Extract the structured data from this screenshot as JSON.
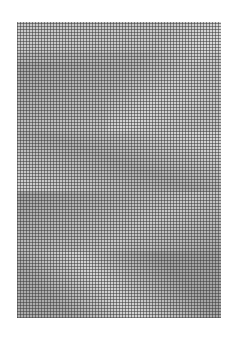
{
  "image": {
    "description": "abstract grid-textured monochrome artwork",
    "background": "#ffffff",
    "grid_color": "#3c3c3c",
    "base_tone": "#b9b9b9"
  }
}
